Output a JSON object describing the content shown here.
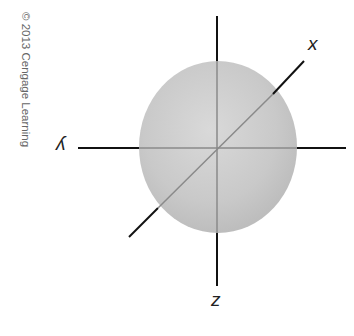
{
  "figure": {
    "type": "3d-axes-sphere",
    "copyright": "© 2013 Cengage Learning",
    "axes": {
      "x_label": "x",
      "y_label": "y",
      "z_label": "z"
    },
    "colors": {
      "sphere_fill": "#c8c8c8",
      "sphere_highlight": "#dcdcdc",
      "axis_outside": "#111111",
      "axis_inside": "#8a8a8a",
      "background": "#ffffff"
    }
  }
}
